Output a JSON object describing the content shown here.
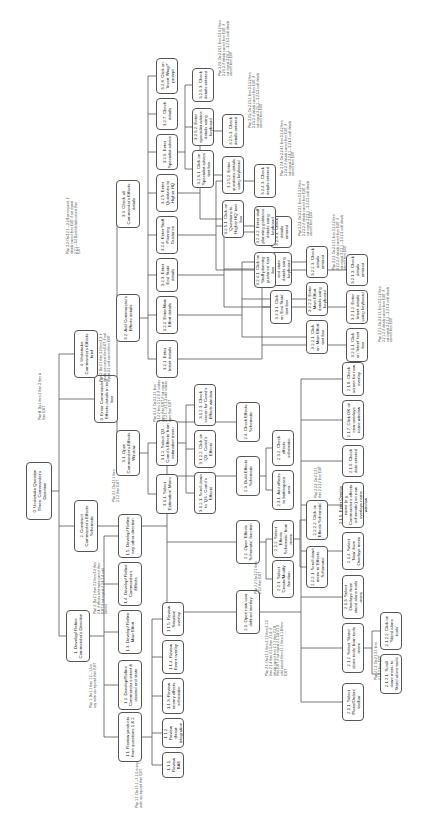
{
  "diagram": {
    "type": "hierarchical-task-analysis",
    "orientation": "rotated-90",
    "line_color": "#555555",
    "box_border_color": "#555555",
    "text_color": "#222222"
  },
  "nodes": [
    {
      "id": "0",
      "label": "0. Undertake Question Three: Commander's Direction",
      "x": 26,
      "y": 462,
      "w": 26,
      "h": 58
    },
    {
      "id": "1",
      "label": "1. Develop/ Refine Commander's Direction",
      "x": 66,
      "y": 610,
      "w": 24,
      "h": 52
    },
    {
      "id": "2",
      "label": "2. Construct Commander's Effects Schematic",
      "x": 74,
      "y": 500,
      "w": 24,
      "h": 52
    },
    {
      "id": "3",
      "label": "3. Enter Commander's Effects details in tool box",
      "x": 94,
      "y": 375,
      "w": 24,
      "h": 48
    },
    {
      "id": "4",
      "label": "4. Undertake Commander's Effects brief",
      "x": 74,
      "y": 330,
      "w": 24,
      "h": 48
    },
    {
      "id": "1.1",
      "label": "1.1. Review products from questions 1 & 2",
      "x": 118,
      "y": 712,
      "w": 24,
      "h": 50
    },
    {
      "id": "1.2",
      "label": "1.2. Develop/Refine Commander's intent & desired end state",
      "x": 118,
      "y": 660,
      "w": 24,
      "h": 50
    },
    {
      "id": "1.3",
      "label": "1.3. Develop/ Refine Main Effort",
      "x": 118,
      "y": 610,
      "w": 24,
      "h": 44
    },
    {
      "id": "1.4",
      "label": "1.4. Develop/ Refine Commander's Effects",
      "x": 118,
      "y": 562,
      "w": 24,
      "h": 44
    },
    {
      "id": "1.5",
      "label": "1.5. Develop/ Refine any other direction",
      "x": 118,
      "y": 514,
      "w": 24,
      "h": 44
    },
    {
      "id": "1.1.1",
      "label": "1.1.1. Review BAE",
      "x": 162,
      "y": 752,
      "w": 22,
      "h": 26
    },
    {
      "id": "1.1.2",
      "label": "1.1.2. Review threat integration",
      "x": 162,
      "y": 718,
      "w": 22,
      "h": 30
    },
    {
      "id": "1.1.3",
      "label": "1.1.3. Review enemy effects schematic",
      "x": 162,
      "y": 678,
      "w": 22,
      "h": 36
    },
    {
      "id": "1.1.4",
      "label": "1.1.4. Review Event overlay",
      "x": 162,
      "y": 640,
      "w": 22,
      "h": 34
    },
    {
      "id": "1.1.5",
      "label": "1.1.5. Review Situation overlay",
      "x": 162,
      "y": 602,
      "w": 22,
      "h": 34
    },
    {
      "id": "2.1",
      "label": "2.1. Open new user defined overlay",
      "x": 236,
      "y": 590,
      "w": 24,
      "h": 44
    },
    {
      "id": "2.2",
      "label": "2.2. Open 'Effects Schematic' function",
      "x": 236,
      "y": 520,
      "w": 24,
      "h": 44
    },
    {
      "id": "2.3",
      "label": "2.3. Build Effects Schematic",
      "x": 236,
      "y": 456,
      "w": 24,
      "h": 40
    },
    {
      "id": "2.4",
      "label": "2.4. Check Effects Schematic",
      "x": 236,
      "y": 402,
      "w": 24,
      "h": 40
    },
    {
      "id": "2.2.1",
      "label": "2.2.1. Select 'Create/Modify' function",
      "x": 272,
      "y": 560,
      "w": 22,
      "h": 38
    },
    {
      "id": "2.2.2",
      "label": "2.2.2. Select 'Effects Schematic' from menu",
      "x": 272,
      "y": 520,
      "w": 22,
      "h": 38
    },
    {
      "id": "2.2.2.1",
      "label": "2.2.2.1. Scroll down menu to 'Effects Schematic'",
      "x": 306,
      "y": 546,
      "w": 22,
      "h": 42
    },
    {
      "id": "2.2.2.2",
      "label": "2.2.2.2. Click on 'Effects Schematic'",
      "x": 306,
      "y": 500,
      "w": 22,
      "h": 40
    },
    {
      "id": "2.3.1",
      "label": "2.3.1. Add effects to battlespace area",
      "x": 272,
      "y": 470,
      "w": 22,
      "h": 40
    },
    {
      "id": "2.3.2",
      "label": "2.3.2. Check effects schematic",
      "x": 272,
      "y": 430,
      "w": 22,
      "h": 36
    },
    {
      "id": "2.1.1",
      "label": "2.1.1. Select 'Plans/Orders' toolbar",
      "x": 342,
      "y": 683,
      "w": 22,
      "h": 38
    },
    {
      "id": "2.1.2",
      "label": "2.1.2. Select 'Stand alone tools' from tools menu",
      "x": 342,
      "y": 623,
      "w": 22,
      "h": 50
    },
    {
      "id": "2.1.3",
      "label": "2.1.3. Select 'Overlays' from stand alone tools menu",
      "x": 342,
      "y": 575,
      "w": 22,
      "h": 44
    },
    {
      "id": "2.1.4",
      "label": "2.1.4. Select 'New' from Overlays menu",
      "x": 342,
      "y": 532,
      "w": 22,
      "h": 38
    },
    {
      "id": "2.1.5",
      "label": "2.1.5. Enter Overlay name (e.g. Commander's effects schematic) on new overlays name window",
      "x": 342,
      "y": 482,
      "w": 22,
      "h": 46
    },
    {
      "id": "2.1.6",
      "label": "2.1.6. Check date entered",
      "x": 342,
      "y": 445,
      "w": 22,
      "h": 32
    },
    {
      "id": "2.1.7",
      "label": "2.1.7. Click OK on new overlays name window",
      "x": 342,
      "y": 400,
      "w": 22,
      "h": 40
    },
    {
      "id": "2.1.8",
      "label": "2.1.8. Check screen for new overlay",
      "x": 342,
      "y": 362,
      "w": 22,
      "h": 34
    },
    {
      "id": "2.1.2.1",
      "label": "2.1.2.1. Scroll down menu to 'Stand alone tools'",
      "x": 380,
      "y": 654,
      "w": 22,
      "h": 40
    },
    {
      "id": "2.1.2.2",
      "label": "2.1.2.2. Click on 'Stand alone tools'",
      "x": 380,
      "y": 612,
      "w": 22,
      "h": 38
    },
    {
      "id": "3.1",
      "label": "3.1. Open Commander's Effects Window",
      "x": 116,
      "y": 430,
      "w": 24,
      "h": 46
    },
    {
      "id": "3.2",
      "label": "3.2. Add Commander's Effects details",
      "x": 116,
      "y": 294,
      "w": 24,
      "h": 48
    },
    {
      "id": "3.3",
      "label": "3.3. Check all Commander's Effects details",
      "x": 116,
      "y": 180,
      "w": 24,
      "h": 48
    },
    {
      "id": "3.1.1",
      "label": "3.1.1. Select 'Estimation' Menu",
      "x": 156,
      "y": 474,
      "w": 22,
      "h": 40
    },
    {
      "id": "3.1.2",
      "label": "3.1.2. Select 'Q3 - Comd's Effects' from estimation menu",
      "x": 156,
      "y": 420,
      "w": 22,
      "h": 46
    },
    {
      "id": "3.1.2.1",
      "label": "3.1.2.1. Scroll down to 'Q3 - Comd's Effects'",
      "x": 194,
      "y": 472,
      "w": 22,
      "h": 42
    },
    {
      "id": "3.1.2.2",
      "label": "3.1.2.2. Click on 'Q3 - Comd's Effects'",
      "x": 194,
      "y": 430,
      "w": 22,
      "h": 38
    },
    {
      "id": "3.1.2.3",
      "label": "3.1.2.3. Check screen for Comd's Effects window",
      "x": 194,
      "y": 384,
      "w": 22,
      "h": 42
    },
    {
      "id": "3.2.1",
      "label": "3.2.1. Enter Intent details",
      "x": 156,
      "y": 340,
      "w": 22,
      "h": 38
    },
    {
      "id": "3.2.2",
      "label": "3.2.2. Enter Main Effort details",
      "x": 156,
      "y": 296,
      "w": 22,
      "h": 38
    },
    {
      "id": "3.2.3",
      "label": "3.2.3. Enter End State details",
      "x": 156,
      "y": 258,
      "w": 22,
      "h": 34
    },
    {
      "id": "3.2.4",
      "label": "3.2.4. Enter Staff Planning Guidance",
      "x": 156,
      "y": 216,
      "w": 22,
      "h": 38
    },
    {
      "id": "3.2.5",
      "label": "3.2.5. Enter Questions to Higher HQ",
      "x": 156,
      "y": 174,
      "w": 22,
      "h": 38
    },
    {
      "id": "3.2.6",
      "label": "3.2.6. Enter Specialist advice",
      "x": 156,
      "y": 134,
      "w": 22,
      "h": 36
    },
    {
      "id": "3.2.7",
      "label": "3.2.7. Check details",
      "x": 156,
      "y": 98,
      "w": 22,
      "h": 32
    },
    {
      "id": "3.2.8",
      "label": "3.2.8. Click on 'Insert Wrap?' prompt",
      "x": 156,
      "y": 58,
      "w": 22,
      "h": 36
    },
    {
      "id": "3.2.1.1",
      "label": "3.2.1.1. Click on 'Intent' text box",
      "x": 346,
      "y": 328,
      "w": 22,
      "h": 34
    },
    {
      "id": "3.2.1.2",
      "label": "3.2.1.2. Enter Intent details using keyboard",
      "x": 346,
      "y": 290,
      "w": 22,
      "h": 34
    },
    {
      "id": "3.2.1.3",
      "label": "3.2.1.3. Check details entered",
      "x": 346,
      "y": 254,
      "w": 22,
      "h": 32
    },
    {
      "id": "3.2.2.1",
      "label": "3.2.2.1. Click on 'Main Effort' text box",
      "x": 306,
      "y": 320,
      "w": 22,
      "h": 34
    },
    {
      "id": "3.2.2.2",
      "label": "3.2.2.2. Enter Main Effort details using keyboard",
      "x": 306,
      "y": 282,
      "w": 22,
      "h": 34
    },
    {
      "id": "3.2.2.3",
      "label": "3.2.2.3. Check details entered",
      "x": 306,
      "y": 246,
      "w": 22,
      "h": 32
    },
    {
      "id": "3.2.3.1",
      "label": "3.2.3.1. Click on 'End State' text box",
      "x": 270,
      "y": 290,
      "w": 22,
      "h": 34
    },
    {
      "id": "3.2.3.2",
      "label": "3.2.3.2. Enter end state details using keyboard",
      "x": 270,
      "y": 252,
      "w": 22,
      "h": 34
    },
    {
      "id": "3.2.3.3",
      "label": "3.2.3.3. Check details entered",
      "x": 270,
      "y": 216,
      "w": 22,
      "h": 32
    },
    {
      "id": "3.2.4.1",
      "label": "3.2.4.1. Click on 'Staff planning guidance' text box",
      "x": 254,
      "y": 252,
      "w": 22,
      "h": 36
    },
    {
      "id": "3.2.4.2",
      "label": "3.2.4.2. Enter staff planning guidance details using keyboard",
      "x": 254,
      "y": 206,
      "w": 22,
      "h": 40
    },
    {
      "id": "3.2.4.3",
      "label": "3.2.4.3. Check details entered",
      "x": 254,
      "y": 164,
      "w": 22,
      "h": 34
    },
    {
      "id": "3.2.5.1",
      "label": "3.2.5.1. Click on 'Questions to Higher HQ' text box",
      "x": 222,
      "y": 200,
      "w": 22,
      "h": 38
    },
    {
      "id": "3.2.5.2",
      "label": "3.2.5.2. Enter questions details using keyboard",
      "x": 222,
      "y": 156,
      "w": 22,
      "h": 38
    },
    {
      "id": "3.2.5.3",
      "label": "3.2.5.3. Check details entered",
      "x": 222,
      "y": 114,
      "w": 22,
      "h": 34
    },
    {
      "id": "3.2.6.1",
      "label": "3.2.6.1. Click on 'Specialist advice' text box",
      "x": 192,
      "y": 150,
      "w": 22,
      "h": 38
    },
    {
      "id": "3.2.6.2",
      "label": "3.2.6.2. Enter specialist advice details using keyboard",
      "x": 192,
      "y": 108,
      "w": 22,
      "h": 38
    },
    {
      "id": "3.2.6.3",
      "label": "3.2.6.3. Check details entered",
      "x": 192,
      "y": 68,
      "w": 22,
      "h": 34
    }
  ],
  "edges": [
    [
      "0",
      "1"
    ],
    [
      "0",
      "2"
    ],
    [
      "0",
      "3"
    ],
    [
      "0",
      "4"
    ],
    [
      "1",
      "1.1"
    ],
    [
      "1",
      "1.2"
    ],
    [
      "1",
      "1.3"
    ],
    [
      "1",
      "1.4"
    ],
    [
      "1",
      "1.5"
    ],
    [
      "1.1",
      "1.1.1"
    ],
    [
      "1.1",
      "1.1.2"
    ],
    [
      "1.1",
      "1.1.3"
    ],
    [
      "1.1",
      "1.1.4"
    ],
    [
      "1.1",
      "1.1.5"
    ],
    [
      "2",
      "2.1"
    ],
    [
      "2",
      "2.2"
    ],
    [
      "2",
      "2.3"
    ],
    [
      "2",
      "2.4"
    ],
    [
      "2.2",
      "2.2.1"
    ],
    [
      "2.2",
      "2.2.2"
    ],
    [
      "2.2.2",
      "2.2.2.1"
    ],
    [
      "2.2.2",
      "2.2.2.2"
    ],
    [
      "2.3",
      "2.3.1"
    ],
    [
      "2.3",
      "2.3.2"
    ],
    [
      "2.1",
      "2.1.1"
    ],
    [
      "2.1",
      "2.1.2"
    ],
    [
      "2.1",
      "2.1.3"
    ],
    [
      "2.1",
      "2.1.4"
    ],
    [
      "2.1",
      "2.1.5"
    ],
    [
      "2.1",
      "2.1.6"
    ],
    [
      "2.1",
      "2.1.7"
    ],
    [
      "2.1",
      "2.1.8"
    ],
    [
      "2.1.2",
      "2.1.2.1"
    ],
    [
      "2.1.2",
      "2.1.2.2"
    ],
    [
      "3",
      "3.1"
    ],
    [
      "3",
      "3.2"
    ],
    [
      "3",
      "3.3"
    ],
    [
      "3.1",
      "3.1.1"
    ],
    [
      "3.1",
      "3.1.2"
    ],
    [
      "3.1.2",
      "3.1.2.1"
    ],
    [
      "3.1.2",
      "3.1.2.2"
    ],
    [
      "3.1.2",
      "3.1.2.3"
    ],
    [
      "3.2",
      "3.2.1"
    ],
    [
      "3.2",
      "3.2.2"
    ],
    [
      "3.2",
      "3.2.3"
    ],
    [
      "3.2",
      "3.2.4"
    ],
    [
      "3.2",
      "3.2.5"
    ],
    [
      "3.2",
      "3.2.6"
    ],
    [
      "3.2",
      "3.2.7"
    ],
    [
      "3.2",
      "3.2.8"
    ],
    [
      "3.2.1",
      "3.2.1.1"
    ],
    [
      "3.2.1",
      "3.2.1.2"
    ],
    [
      "3.2.1",
      "3.2.1.3"
    ],
    [
      "3.2.2",
      "3.2.2.1"
    ],
    [
      "3.2.2",
      "3.2.2.2"
    ],
    [
      "3.2.2",
      "3.2.2.3"
    ],
    [
      "3.2.3",
      "3.2.3.1"
    ],
    [
      "3.2.3",
      "3.2.3.2"
    ],
    [
      "3.2.3",
      "3.2.3.3"
    ],
    [
      "3.2.4",
      "3.2.4.1"
    ],
    [
      "3.2.4",
      "3.2.4.2"
    ],
    [
      "3.2.4",
      "3.2.4.3"
    ],
    [
      "3.2.5",
      "3.2.5.1"
    ],
    [
      "3.2.5",
      "3.2.5.2"
    ],
    [
      "3.2.5",
      "3.2.5.3"
    ],
    [
      "3.2.6",
      "3.2.6.1"
    ],
    [
      "3.2.6",
      "3.2.6.2"
    ],
    [
      "3.2.6",
      "3.2.6.3"
    ]
  ],
  "plans": [
    {
      "label": "Plan 0: Do 1 then 2 then 3 then 4 then EXIT",
      "x": 36,
      "y": 370,
      "w": 14,
      "h": 50
    },
    {
      "label": "Plan 1: Do 1.1 then 1.2 – 1.5 in any order as required then EXIT",
      "x": 86,
      "y": 660,
      "w": 16,
      "h": 48
    },
    {
      "label": "Plan 1.1: Do 1.1.1 – 1.1.5 in any order as required then EXIT",
      "x": 132,
      "y": 760,
      "w": 16,
      "h": 48
    },
    {
      "label": "Plan 2: Do 2.1 then 2.2 then 2.3 then 2.4; if effects schematic correct then EXIT, if not repeat 2.3 & 2.4 until correct",
      "x": 92,
      "y": 560,
      "w": 20,
      "h": 54
    },
    {
      "label": "Plan 3: Do 3.1 then 3.2 then 3.3; if details are correct then EXIT, if not repeat 3.2 until correct then EXIT",
      "x": 96,
      "y": 328,
      "w": 20,
      "h": 54
    },
    {
      "label": "Plan 3.1: Do 3.1.1 then 3.1.2 then EXIT",
      "x": 110,
      "y": 462,
      "w": 14,
      "h": 40
    },
    {
      "label": "Plan 3.1.2: Do 3.1.2.1 then 3.1.2.2 then 3.1.2.3; if window open then EXIT, if not repeat 3.1.2.1 – 3.1.2.3 until window open then EXIT",
      "x": 152,
      "y": 374,
      "w": 22,
      "h": 48
    },
    {
      "label": "Plan 3.3: Do 3.2.1 – 3.2.8 as required; if details correct then EXIT, if not repeat 3.2.1 – 3.2.8 until details correct then EXIT",
      "x": 64,
      "y": 196,
      "w": 22,
      "h": 58
    },
    {
      "label": "Plan 2.1: Do 2.1.1 then 2.1.2 then 2.1.3 then 2.1.4 then 2.1.5 then 2.1.6; if details correct then 2.1.7 then 2.1.8 then EXIT, if not repeat 2.1.5 & 2.1.6 until correct then 2.1.7 then 2.1.8 then EXIT",
      "x": 262,
      "y": 620,
      "w": 30,
      "h": 56
    },
    {
      "label": "Plan 2.2: Do 2.2.1 then 2.2.2 then EXIT",
      "x": 252,
      "y": 556,
      "w": 14,
      "h": 38
    },
    {
      "label": "Plan 2.2.2: Do 2.2.2.1 then 2.2.2.2 then EXIT",
      "x": 312,
      "y": 462,
      "w": 14,
      "h": 36
    },
    {
      "label": "Plan 2.1.2: Do 2.1.2.1 then 2.1.2.2 then EXIT",
      "x": 372,
      "y": 640,
      "w": 14,
      "h": 40
    },
    {
      "label": "Plan 3.2.1: Do 3.2.1.1 then 3.2.1.2 then 3.2.1.3; if details correct then EXIT, if not repeat 3.2.1.1 – 3.2.1.3 until details correct then EXIT",
      "x": 376,
      "y": 286,
      "w": 22,
      "h": 56
    },
    {
      "label": "Plan 3.2.2: Do 3.2.2.1 then 3.2.2.2 then 3.2.2.3; if details correct then EXIT, if not repeat 3.2.2.1 – 3.2.2.3 until details correct then EXIT",
      "x": 330,
      "y": 214,
      "w": 22,
      "h": 56
    },
    {
      "label": "Plan 3.2.3: Do 3.2.3.1 then 3.2.3.2 then 3.2.3.3; if details correct then EXIT, if not repeat 3.2.3.1 – 3.2.3.3 until details correct then EXIT",
      "x": 296,
      "y": 180,
      "w": 22,
      "h": 56
    },
    {
      "label": "Plan 3.2.4: Do 3.2.4.1 then 3.2.4.2 then 3.2.4.3; if details correct then EXIT, if not repeat 3.2.4.1 – 3.2.4.3 until details correct then EXIT",
      "x": 278,
      "y": 120,
      "w": 22,
      "h": 56
    },
    {
      "label": "Plan 3.2.5: Do 3.2.5.1 then 3.2.5.2 then 3.2.5.3; if details correct then EXIT, if not repeat 3.2.5.1 – 3.2.5.3 until details correct then EXIT",
      "x": 246,
      "y": 72,
      "w": 22,
      "h": 56
    },
    {
      "label": "Plan 3.2.6: Do 3.2.6.1 then 3.2.6.2 then 3.2.6.3; if details correct then EXIT, if not repeat 3.2.6.1 – 3.2.6.3 until details correct then EXIT",
      "x": 216,
      "y": 20,
      "w": 22,
      "h": 56
    }
  ]
}
